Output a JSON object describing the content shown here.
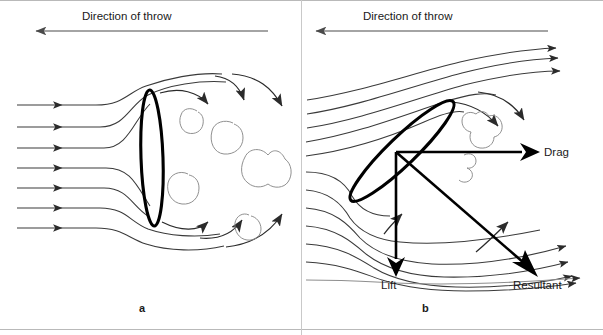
{
  "figure": {
    "width": 603,
    "height": 335,
    "background": "#ffffff",
    "line_color_streamline": "#3a3a3a",
    "line_color_object": "#000000",
    "line_color_eddy": "#7a7a7a",
    "line_color_vector": "#000000",
    "text_color": "#1a1a1a"
  },
  "panels": [
    {
      "id": "a",
      "label": "a",
      "label_x": 142,
      "label_y": 309,
      "direction_label": "Direction of throw",
      "direction_label_x": 82,
      "direction_label_y": 12,
      "direction_arrow": {
        "x1": 268,
        "y1": 31,
        "x2": 33,
        "y2": 31,
        "points": "left"
      },
      "object": {
        "type": "ellipse",
        "cx": 152,
        "cy": 158,
        "rx": 11,
        "ry": 68,
        "rotation": -2,
        "stroke_width": 3
      },
      "attack_angle_deg": 0,
      "streamline_count": 7,
      "streamline_start_x": 17,
      "streamline_arrow_x": 70,
      "eddy_count": 7,
      "description": "Discus edge-on to airflow; laminar streamlines split and large turbulent wake eddies form behind"
    },
    {
      "id": "b",
      "label": "b",
      "label_x": 425,
      "label_y": 309,
      "direction_label": "Direction of throw",
      "direction_label_x": 363,
      "direction_label_y": 12,
      "direction_arrow": {
        "x1": 548,
        "y1": 31,
        "x2": 313,
        "y2": 31,
        "points": "left"
      },
      "object": {
        "type": "ellipse",
        "cx": 402,
        "cy": 151,
        "rx": 71,
        "ry": 14,
        "rotation": -44,
        "stroke_width": 3
      },
      "attack_angle_deg": 44,
      "streamline_count": 10,
      "eddy_count": 2,
      "description": "Discus inclined at an angle of attack; deflected streamlines generate lift, drag and a resultant force"
    }
  ],
  "force_vectors": {
    "origin": {
      "x": 396,
      "y": 152
    },
    "items": [
      {
        "name": "drag",
        "label": "Drag",
        "label_x": 545,
        "label_y": 146,
        "x1": 396,
        "y1": 152,
        "x2": 536,
        "y2": 152,
        "head": "filled"
      },
      {
        "name": "lift",
        "label": "Lift",
        "label_x": 381,
        "label_y": 280,
        "x1": 396,
        "y1": 152,
        "x2": 396,
        "y2": 272,
        "head": "filled"
      },
      {
        "name": "resultant",
        "label": "Resultant",
        "label_x": 514,
        "label_y": 280,
        "x1": 396,
        "y1": 152,
        "x2": 534,
        "y2": 272,
        "head": "filled"
      }
    ]
  },
  "borders": {
    "top_divider_y": 0,
    "bottom_divider_y": 330,
    "panel_split_x": 301
  }
}
